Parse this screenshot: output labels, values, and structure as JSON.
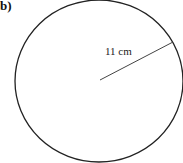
{
  "figure": {
    "part_label": "b)",
    "shape": "circle",
    "radius_label": "11 cm",
    "radius_value": 11,
    "unit": "cm",
    "stroke_color": "#222222"
  }
}
